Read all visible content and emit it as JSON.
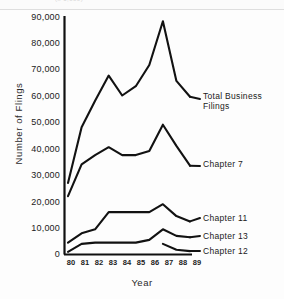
{
  "figure": {
    "top_artifact_text": "(x 1,000)",
    "xlabel": "Year",
    "ylabel": "Number  of  Flings"
  },
  "chart_data": {
    "type": "line",
    "title": "",
    "xlabel": "Year",
    "ylabel": "Number of Flings",
    "x": [
      "80",
      "81",
      "82",
      "83",
      "84",
      "85",
      "86",
      "87",
      "88",
      "89"
    ],
    "xlim": [
      1980,
      1989
    ],
    "ylim": [
      0,
      90000
    ],
    "yticks": [
      0,
      10000,
      20000,
      30000,
      40000,
      50000,
      60000,
      70000,
      80000,
      90000
    ],
    "ytick_labels": [
      "0",
      "10,000",
      "20,000",
      "30,000",
      "40,000",
      "50,000",
      "60,000",
      "70,000",
      "80,000",
      "90,000"
    ],
    "grid": false,
    "legend": "inline-right",
    "series": [
      {
        "name": "Total  Business  Filings",
        "label_lines": [
          "Total  Business",
          "Filings"
        ],
        "values": [
          27000,
          48000,
          58000,
          67500,
          60000,
          63500,
          71500,
          88000,
          65500,
          59500
        ]
      },
      {
        "name": "Chapter  7",
        "label_lines": [
          "Chapter  7"
        ],
        "values": [
          22000,
          34000,
          37500,
          40500,
          37500,
          37500,
          39000,
          49000,
          41000,
          33500
        ]
      },
      {
        "name": "Chapter  11",
        "label_lines": [
          "Chapter  11"
        ],
        "values": [
          4500,
          8000,
          9500,
          16000,
          16000,
          16000,
          16000,
          19000,
          14500,
          12500
        ]
      },
      {
        "name": "Chapter  13",
        "label_lines": [
          "Chapter  13"
        ],
        "values": [
          1000,
          4000,
          4500,
          4500,
          4500,
          4500,
          5500,
          9500,
          7000,
          6500
        ]
      },
      {
        "name": "Chapter  12",
        "label_lines": [
          "Chapter  12"
        ],
        "values": [
          null,
          null,
          null,
          null,
          null,
          null,
          null,
          4000,
          1800,
          1300
        ]
      }
    ],
    "colors": {
      "line": "#121212",
      "axis": "#101010",
      "background": "#fdfdfd"
    }
  }
}
